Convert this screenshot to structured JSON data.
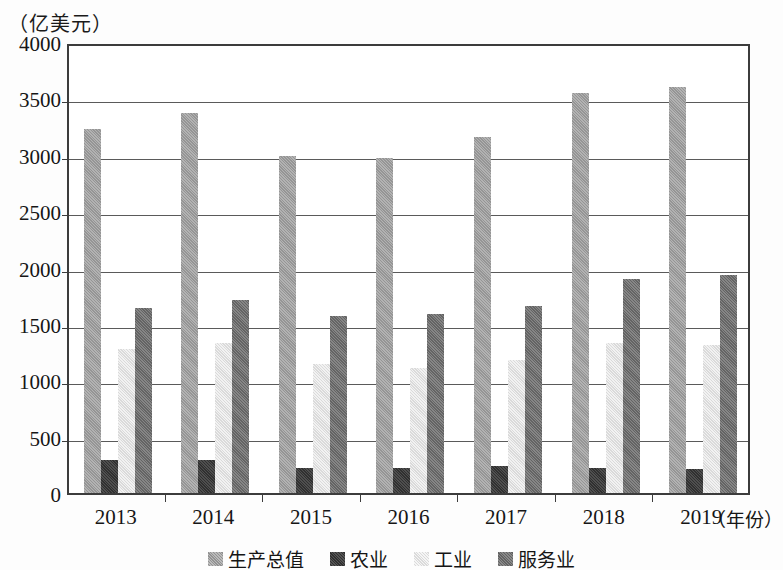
{
  "chart_data": {
    "type": "bar",
    "title": "",
    "subtitle": "",
    "unit_caption": "（亿美元）",
    "xlabel": "（年份）",
    "ylabel": "",
    "categories": [
      "2013",
      "2014",
      "2015",
      "2016",
      "2017",
      "2018",
      "2019"
    ],
    "series": [
      {
        "name": "生产总值",
        "color": "#9d9d9d",
        "values": [
          3230,
          3370,
          2990,
          2970,
          3160,
          3550,
          3600
        ]
      },
      {
        "name": "农业",
        "color": "#3b3b3b",
        "values": [
          290,
          290,
          225,
          225,
          240,
          225,
          210
        ]
      },
      {
        "name": "工业",
        "color": "#e3e3e3",
        "values": [
          1280,
          1330,
          1140,
          1110,
          1180,
          1330,
          1310
        ]
      },
      {
        "name": "服务业",
        "color": "#6f6f6f",
        "values": [
          1640,
          1710,
          1570,
          1585,
          1660,
          1900,
          1930
        ]
      }
    ],
    "ylim": [
      0,
      4000
    ],
    "y_ticks": [
      0,
      500,
      1000,
      1500,
      2000,
      2500,
      3000,
      3500,
      4000
    ],
    "y_tick_labels": [
      "0",
      "500",
      "1000",
      "1500",
      "2000",
      "2500",
      "3000",
      "3500",
      "4000"
    ],
    "grid": true,
    "legend_position": "bottom"
  },
  "legend": {
    "items": [
      {
        "label": "生产总值"
      },
      {
        "label": "农业"
      },
      {
        "label": "工业"
      },
      {
        "label": "服务业"
      }
    ]
  }
}
